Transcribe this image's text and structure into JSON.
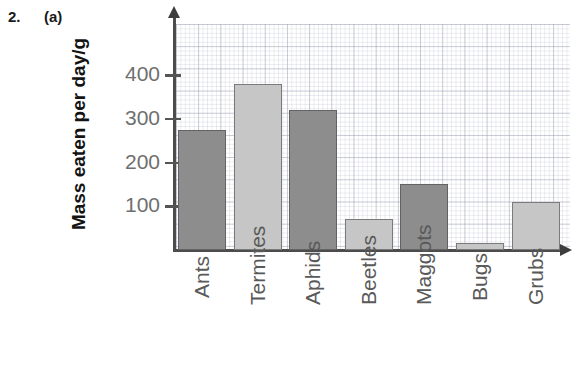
{
  "question": {
    "number": "2.",
    "part": "(a)"
  },
  "chart_data": {
    "type": "bar",
    "title": "",
    "xlabel": "",
    "ylabel": "Mass eaten per day/g",
    "categories": [
      "Ants",
      "Termites",
      "Aphids",
      "Beetles",
      "Maggots",
      "Bugs",
      "Grubs"
    ],
    "values": [
      275,
      380,
      320,
      70,
      150,
      15,
      110
    ],
    "series": [
      {
        "name": "Mass eaten per day",
        "values": [
          275,
          380,
          320,
          70,
          150,
          15,
          110
        ]
      }
    ],
    "bar_shades": [
      "dark",
      "light",
      "dark",
      "light",
      "dark",
      "light",
      "light"
    ],
    "ylim": [
      0,
      450
    ],
    "yticks": [
      100,
      200,
      300,
      400
    ],
    "ytick_labels": [
      "100",
      "200",
      "300",
      "400"
    ],
    "grid": "graph-paper",
    "legend": "none",
    "axis_arrows": true
  },
  "colors": {
    "bar_dark": "#8d8d8d",
    "bar_light": "#c6c6c6",
    "bar_outline": "#6c6c6c",
    "axis": "#4c4c4c",
    "tick_text": "#6f6f6f",
    "category_text": "#595959",
    "axis_title_text": "#131313",
    "grid_line": "#969bAF",
    "background": "#ffffff"
  }
}
